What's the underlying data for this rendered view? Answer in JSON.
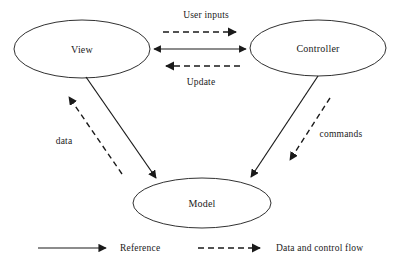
{
  "diagram": {
    "background_color": "#ffffff",
    "stroke_color": "#1a1a1a",
    "nodes": [
      {
        "id": "view",
        "label": "View",
        "shape": "ellipse",
        "cx": 82,
        "cy": 49,
        "rx": 68,
        "ry": 29
      },
      {
        "id": "controller",
        "label": "Controller",
        "shape": "ellipse",
        "cx": 318,
        "cy": 48,
        "rx": 68,
        "ry": 28
      },
      {
        "id": "model",
        "label": "Model",
        "shape": "ellipse",
        "cx": 202,
        "cy": 203,
        "rx": 69,
        "ry": 25
      }
    ],
    "edges": [
      {
        "id": "user-inputs",
        "label": "User inputs",
        "style": "dashed",
        "from": "view",
        "to": "controller",
        "direction": "right"
      },
      {
        "id": "view-controller-reference",
        "label": "",
        "style": "solid",
        "from": "view",
        "to": "controller",
        "direction": "both"
      },
      {
        "id": "update",
        "label": "Update",
        "style": "dashed",
        "from": "controller",
        "to": "view",
        "direction": "left"
      },
      {
        "id": "view-model-reference",
        "label": "",
        "style": "solid",
        "from": "view",
        "to": "model",
        "direction": "down"
      },
      {
        "id": "data",
        "label": "data",
        "style": "dashed",
        "from": "model",
        "to": "view",
        "direction": "up"
      },
      {
        "id": "controller-model-reference",
        "label": "",
        "style": "solid",
        "from": "controller",
        "to": "model",
        "direction": "down"
      },
      {
        "id": "commands",
        "label": "commands",
        "style": "dashed",
        "from": "controller",
        "to": "model",
        "direction": "down"
      }
    ]
  },
  "legend": {
    "items": [
      {
        "id": "reference",
        "label": "Reference",
        "style": "solid"
      },
      {
        "id": "data-and-control-flow",
        "label": "Data and control flow",
        "style": "dashed"
      }
    ]
  }
}
